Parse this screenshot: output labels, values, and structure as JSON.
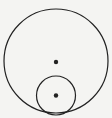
{
  "diagram": {
    "background": "#f4f4f2",
    "stroke_color": "#222222",
    "large_circle": {
      "cx": 56,
      "cy": 61,
      "r": 52,
      "center_dot": {
        "cx": 56,
        "cy": 62,
        "r": 2.2
      }
    },
    "small_circle": {
      "cx": 56,
      "cy": 95.5,
      "r": 19.5,
      "center_dot": {
        "cx": 56,
        "cy": 95.5,
        "r": 2.2
      }
    }
  }
}
